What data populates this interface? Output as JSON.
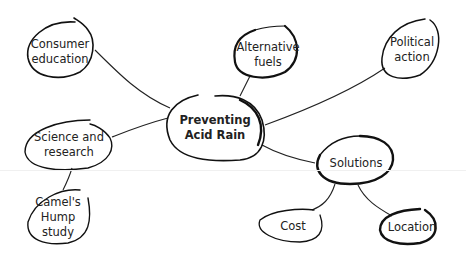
{
  "diagram": {
    "type": "mind-map",
    "center": {
      "label": "Preventing Acid Rain",
      "lines": [
        "Preventing",
        "Acid Rain"
      ]
    },
    "nodes": [
      {
        "id": "consumer-education",
        "lines": [
          "Consumer",
          "education"
        ],
        "parent": "center"
      },
      {
        "id": "alternative-fuels",
        "lines": [
          "Alternative",
          "fuels"
        ],
        "parent": "center"
      },
      {
        "id": "political-action",
        "lines": [
          "Political",
          "action"
        ],
        "parent": "center"
      },
      {
        "id": "science-and-research",
        "lines": [
          "Science and",
          "research"
        ],
        "parent": "center"
      },
      {
        "id": "camels-hump-study",
        "lines": [
          "Camel's",
          "Hump",
          "study"
        ],
        "parent": "science-and-research"
      },
      {
        "id": "solutions",
        "lines": [
          "Solutions"
        ],
        "parent": "center"
      },
      {
        "id": "cost",
        "lines": [
          "Cost"
        ],
        "parent": "solutions"
      },
      {
        "id": "location",
        "lines": [
          "Location"
        ],
        "parent": "solutions"
      }
    ],
    "colors": {
      "ink": "#111111",
      "background": "#ffffff"
    }
  }
}
